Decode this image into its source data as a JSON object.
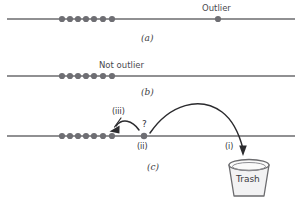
{
  "figure": {
    "width": 300,
    "height": 202,
    "background": "#ffffff",
    "line_color": "#6b6b6e",
    "dot_color": "#6e6e73",
    "arrow_color": "#2b2b2e",
    "text_color": "#3d3d42"
  },
  "panels": [
    {
      "id": "a",
      "caption": "(a)",
      "caption_x": 141,
      "caption_y": 34,
      "axis": {
        "x1": 7,
        "x2": 295,
        "y": 19
      },
      "cluster": {
        "dots": [
          {
            "cx": 62,
            "cy": 19,
            "r": 3.1
          },
          {
            "cx": 70,
            "cy": 19,
            "r": 3.1
          },
          {
            "cx": 78,
            "cy": 19,
            "r": 3.1
          },
          {
            "cx": 86,
            "cy": 19,
            "r": 3.1
          },
          {
            "cx": 94,
            "cy": 19,
            "r": 3.1
          },
          {
            "cx": 103,
            "cy": 19,
            "r": 3.1
          },
          {
            "cx": 112,
            "cy": 19,
            "r": 3.1
          }
        ]
      },
      "outlier_dot": {
        "cx": 218,
        "cy": 19,
        "r": 3.1
      },
      "labels": [
        {
          "name": "outlier-label",
          "text": "Outlier",
          "x": 204,
          "y": 5
        }
      ]
    },
    {
      "id": "b",
      "caption": "(b)",
      "caption_x": 141,
      "caption_y": 88,
      "axis": {
        "x1": 7,
        "x2": 295,
        "y": 76
      },
      "cluster": {
        "dots": [
          {
            "cx": 62,
            "cy": 76,
            "r": 3.1
          },
          {
            "cx": 70,
            "cy": 76,
            "r": 3.1
          },
          {
            "cx": 78,
            "cy": 76,
            "r": 3.1
          },
          {
            "cx": 86,
            "cy": 76,
            "r": 3.1
          },
          {
            "cx": 94,
            "cy": 76,
            "r": 3.1
          },
          {
            "cx": 103,
            "cy": 76,
            "r": 3.1
          },
          {
            "cx": 112,
            "cy": 76,
            "r": 3.1
          }
        ]
      },
      "labels": [
        {
          "name": "not-outlier-label",
          "text": "Not outlier",
          "x": 101,
          "y": 62
        }
      ]
    },
    {
      "id": "c",
      "caption": "(c)",
      "caption_x": 147,
      "caption_y": 163,
      "axis": {
        "x1": 7,
        "x2": 295,
        "y": 136
      },
      "cluster": {
        "dots": [
          {
            "cx": 62,
            "cy": 136,
            "r": 3.1
          },
          {
            "cx": 70,
            "cy": 136,
            "r": 3.1
          },
          {
            "cx": 78,
            "cy": 136,
            "r": 3.1
          },
          {
            "cx": 86,
            "cy": 136,
            "r": 3.1
          },
          {
            "cx": 94,
            "cy": 136,
            "r": 3.1
          },
          {
            "cx": 103,
            "cy": 136,
            "r": 3.1
          },
          {
            "cx": 112,
            "cy": 136,
            "r": 3.1
          }
        ]
      },
      "candidate_dot": {
        "cx": 144,
        "cy": 136,
        "r": 3.2
      },
      "labels": [
        {
          "name": "step-iii-label",
          "text": "(iii)",
          "x": 112,
          "y": 110
        },
        {
          "name": "step-ii-label",
          "text": "(ii)",
          "x": 138,
          "y": 143
        },
        {
          "name": "step-i-label",
          "text": "(i)",
          "x": 227,
          "y": 143
        },
        {
          "name": "question-mark",
          "text": "?",
          "x": 142,
          "y": 121
        }
      ]
    }
  ],
  "trash": {
    "label": "Trash",
    "label_x": 237,
    "label_y": 176,
    "top_cx": 249,
    "top_cy": 165,
    "top_rx": 20,
    "top_ry": 5.5,
    "bottom_half_width": 15,
    "bottom_y": 196,
    "fill": "#f2f2f3",
    "stroke": "#6b6b6e"
  },
  "arrows": {
    "discard": {
      "name": "discard-arc",
      "path": "M 150 133 C 170 104, 200 96, 222 112 C 234 121, 240 137, 243 149",
      "head": "M 243 156 L 239.2 145.6 L 246.8 145.6 Z"
    },
    "keep": {
      "name": "keep-arc",
      "path": "M 139 130 C 132 120, 122 118, 116 126",
      "head": "M 110 131 L 120.0 126.2 L 119.0 133.0 Z"
    },
    "pointer_iii": {
      "name": "step-iii-pointer",
      "path": "M 120 117 L 113 128"
    }
  }
}
